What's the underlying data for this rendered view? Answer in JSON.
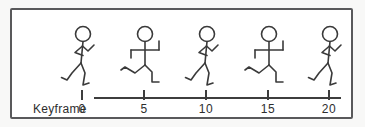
{
  "diagram": {
    "panel": {
      "background": "#ffffff",
      "border_color": "#59595b",
      "outer_background": "#f8f8f7",
      "stroke_color": "#3a3a3a"
    },
    "axis": {
      "label": "Keyframe",
      "ticks": [
        "0",
        "5",
        "10",
        "15",
        "20"
      ],
      "range": [
        0,
        20
      ],
      "tick_interval": 5
    },
    "figures": [
      {
        "keyframe": "0",
        "pose": "walk"
      },
      {
        "keyframe": "5",
        "pose": "run"
      },
      {
        "keyframe": "10",
        "pose": "walk"
      },
      {
        "keyframe": "15",
        "pose": "run"
      },
      {
        "keyframe": "20",
        "pose": "walk"
      }
    ]
  }
}
